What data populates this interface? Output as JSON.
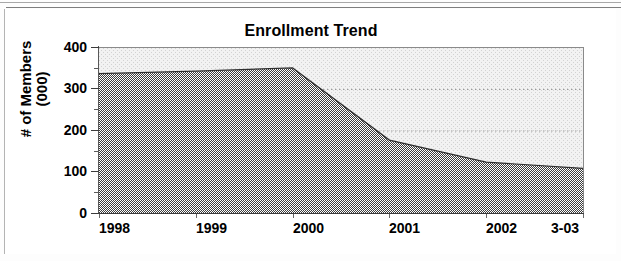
{
  "chart_data": {
    "type": "area",
    "title": "Enrollment Trend",
    "xlabel": "",
    "ylabel": "# of Members (000)",
    "ylabel_line1": "# of Members",
    "ylabel_line2": "(000)",
    "categories": [
      "1998",
      "1999",
      "2000",
      "2001",
      "2002",
      "3-03"
    ],
    "values": [
      338,
      344,
      352,
      178,
      125,
      110
    ],
    "series": [
      {
        "name": "Enrollment",
        "values": [
          338,
          344,
          352,
          178,
          125,
          110
        ]
      }
    ],
    "ylim": [
      0,
      400
    ],
    "ytick_labels": [
      "400",
      "300",
      "200",
      "100",
      "0"
    ],
    "ytick_values": [
      400,
      300,
      200,
      100,
      0
    ],
    "yminor_values": [
      350,
      250,
      150,
      50
    ],
    "ytick_interval": 100,
    "yminor_interval": 50,
    "grid": "horizontal-dotted",
    "gridline_values": [
      300,
      200,
      100
    ],
    "legend": "none",
    "legend_position": "none",
    "plot_background": "#f0f0f0",
    "area_fill": "#4a4a4a",
    "area_pattern": "50-percent-checkerboard-dither",
    "axis_color": "#3b3b3b"
  },
  "colors": {
    "page_background": "#fdfdfd",
    "plot_background": "#f0f0f0",
    "series_fill": "#4a4a4a",
    "text": "#000000",
    "axis": "#3b3b3b",
    "gridline": "#9a9a9a",
    "frame_border": "#b4b4b4"
  }
}
